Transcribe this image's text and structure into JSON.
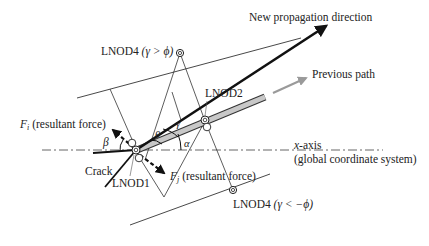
{
  "diagram": {
    "title": "",
    "labels": {
      "new_propagation": "New propagation direction",
      "previous_path": "Previous path",
      "lnod4_top": "LNOD4 (γ > ϕ)",
      "lnod4_top_name": "LNOD4",
      "lnod4_top_cond": "(γ > ϕ)",
      "lnod2": "LNOD2",
      "lnod1": "LNOD1",
      "lnod4_bottom_name": "LNOD4",
      "lnod4_bottom_cond": "(γ < −ϕ)",
      "fi_symbol": "F",
      "fi_sub": "i",
      "fi_text": "(resultant force)",
      "fj_symbol": "F",
      "fj_sub": "j",
      "fj_text": "(resultant force)",
      "x_axis": "x",
      "x_axis_suffix": "-axis",
      "x_axis_sub": "(global coordinate system)",
      "crack": "Crack",
      "angle_beta": "β",
      "angle_gamma": "γ",
      "angle_theta": "θ",
      "angle_alpha": "α"
    },
    "nodes": [
      {
        "id": "LNOD1",
        "x": 136,
        "y": 150
      },
      {
        "id": "LNOD2",
        "x": 205,
        "y": 121
      },
      {
        "id": "LNOD4_top",
        "x": 180,
        "y": 53
      },
      {
        "id": "LNOD4_bottom",
        "x": 233,
        "y": 190
      }
    ],
    "colors": {
      "line": "#222222",
      "previous_path_fill": "#c8c8c8",
      "previous_arrow": "#9a9a9a",
      "axis": "#555555"
    }
  }
}
